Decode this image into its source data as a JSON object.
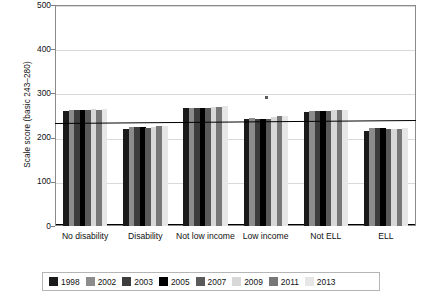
{
  "chart_data": {
    "type": "bar",
    "title": "",
    "xlabel": "",
    "ylabel": "Scale score (basic 243–280)",
    "ylim": [
      0,
      500
    ],
    "yticks": [
      0,
      100,
      200,
      300,
      400,
      500
    ],
    "ytick_labels": [
      "0",
      "100",
      "200",
      "300",
      "400",
      "500"
    ],
    "grid": true,
    "legend_position": "bottom",
    "categories": [
      "No disability",
      "Disability",
      "Not low income",
      "Low income",
      "Not ELL",
      "ELL"
    ],
    "series": [
      {
        "name": "1998",
        "color": "#1a1a1a",
        "values": [
          261,
          220,
          266,
          243,
          258,
          215
        ]
      },
      {
        "name": "2002",
        "color": "#8c8c8c",
        "values": [
          263,
          224,
          268,
          244,
          261,
          222
        ]
      },
      {
        "name": "2003",
        "color": "#3d3d3d",
        "values": [
          262,
          223,
          266,
          242,
          260,
          221
        ]
      },
      {
        "name": "2005",
        "color": "#000000",
        "values": [
          263,
          223,
          267,
          243,
          261,
          222
        ]
      },
      {
        "name": "2007",
        "color": "#5a5a5a",
        "values": [
          262,
          222,
          267,
          242,
          260,
          220
        ]
      },
      {
        "name": "2009",
        "color": "#d8d8d8",
        "values": [
          264,
          224,
          270,
          246,
          262,
          220
        ]
      },
      {
        "name": "2011",
        "color": "#777777",
        "values": [
          263,
          226,
          270,
          248,
          262,
          219
        ]
      },
      {
        "name": "2013",
        "color": "#e6e6e6",
        "values": [
          265,
          227,
          272,
          248,
          263,
          221
        ]
      }
    ],
    "reference_line": {
      "label": "basic",
      "value_left": 234,
      "value_right": 241
    },
    "annotations": [
      {
        "name": "stray-mark",
        "x_fraction": 0.582,
        "value": 293
      }
    ]
  },
  "legend": {
    "entries": [
      {
        "label": "1998",
        "color": "#1a1a1a"
      },
      {
        "label": "2002",
        "color": "#8c8c8c"
      },
      {
        "label": "2003",
        "color": "#3d3d3d"
      },
      {
        "label": "2005",
        "color": "#000000"
      },
      {
        "label": "2007",
        "color": "#5a5a5a"
      },
      {
        "label": "2009",
        "color": "#d8d8d8"
      },
      {
        "label": "2011",
        "color": "#777777"
      },
      {
        "label": "2013",
        "color": "#e6e6e6"
      }
    ]
  }
}
